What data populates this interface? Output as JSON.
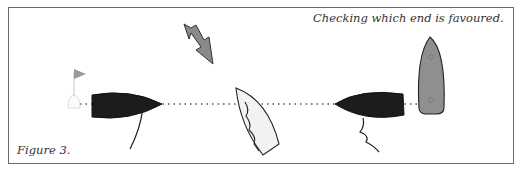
{
  "figure": {
    "title": "Checking which end is favoured.",
    "label": "Figure 3."
  },
  "elements": {
    "pin_mark": {
      "type": "buoy-with-flag",
      "flag_color": "#9a9a9a"
    },
    "start_line": {
      "style": "dotted",
      "color": "#555555"
    },
    "wind_arrow": {
      "color": "#8a8a8a",
      "direction": "down-right"
    },
    "boats": [
      {
        "id": "left-dark-boat",
        "fill": "#1c1c1c",
        "heading": "right"
      },
      {
        "id": "center-white-boat",
        "fill": "#f2f2f2",
        "heading": "up-left"
      },
      {
        "id": "right-dark-boat",
        "fill": "#1c1c1c",
        "heading": "left"
      },
      {
        "id": "committee-boat",
        "fill": "#8f8f8f",
        "heading": "up"
      }
    ]
  },
  "colors": {
    "frame_border": "#6a6a6a",
    "text": "#333333",
    "background": "#ffffff"
  }
}
